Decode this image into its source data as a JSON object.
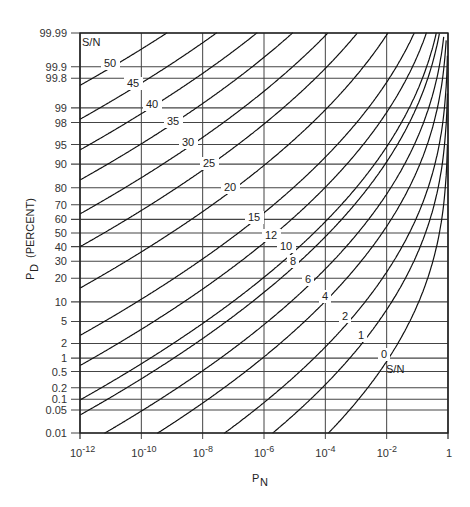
{
  "chart_data": {
    "type": "line",
    "title": "",
    "xlabel": "P_N",
    "ylabel": "P_D (PERCENT)",
    "xscale": "log",
    "yscale": "probability",
    "xlim": [
      1e-12,
      1
    ],
    "ylim": [
      0.01,
      99.99
    ],
    "grid": true,
    "x_ticks": [
      {
        "base": "10",
        "exp": "-12",
        "log": -12
      },
      {
        "base": "10",
        "exp": "-10",
        "log": -10
      },
      {
        "base": "10",
        "exp": "-8",
        "log": -8
      },
      {
        "base": "10",
        "exp": "-6",
        "log": -6
      },
      {
        "base": "10",
        "exp": "-4",
        "log": -4
      },
      {
        "base": "10",
        "exp": "-2",
        "log": -2
      },
      {
        "base": "1",
        "exp": "",
        "log": 0
      }
    ],
    "y_ticks": [
      "99.99",
      "99.9",
      "99.8",
      "99",
      "98",
      "95",
      "90",
      "80",
      "70",
      "60",
      "50",
      "40",
      "30",
      "20",
      "10",
      "5",
      "2",
      "1",
      "0.5",
      "0.2",
      "0.1",
      "0.05",
      "0.01"
    ],
    "legend_title": "S/N",
    "series": [
      {
        "name": "50",
        "d": 9.78,
        "label_pos": [
          104,
          67
        ]
      },
      {
        "name": "45",
        "d": 9.15,
        "label_pos": [
          127,
          87
        ]
      },
      {
        "name": "40",
        "d": 8.58,
        "label_pos": [
          146,
          108
        ]
      },
      {
        "name": "35",
        "d": 8.02,
        "label_pos": [
          167,
          125
        ]
      },
      {
        "name": "30",
        "d": 7.39,
        "label_pos": [
          182,
          146
        ]
      },
      {
        "name": "25",
        "d": 6.78,
        "label_pos": [
          203,
          167
        ]
      },
      {
        "name": "20",
        "d": 6.01,
        "label_pos": [
          224,
          191
        ]
      },
      {
        "name": "15",
        "d": 5.13,
        "label_pos": [
          248,
          221
        ]
      },
      {
        "name": "12",
        "d": 4.57,
        "label_pos": [
          265,
          239
        ]
      },
      {
        "name": "10",
        "d": 3.93,
        "label_pos": [
          280,
          250
        ]
      },
      {
        "name": "8",
        "d": 3.65,
        "label_pos": [
          290,
          265
        ]
      },
      {
        "name": "6",
        "d": 3.05,
        "label_pos": [
          305,
          283
        ]
      },
      {
        "name": "4",
        "d": 2.45,
        "label_pos": [
          322,
          300
        ]
      },
      {
        "name": "2",
        "d": 1.6,
        "label_pos": [
          342,
          320
        ]
      },
      {
        "name": "1",
        "d": 0.9,
        "label_pos": [
          358,
          339
        ]
      },
      {
        "name": "0",
        "d": -0.06,
        "label_pos": [
          381,
          358
        ]
      }
    ],
    "annotations": [
      {
        "text": "S/N",
        "pos": [
          386,
          373
        ]
      }
    ]
  }
}
